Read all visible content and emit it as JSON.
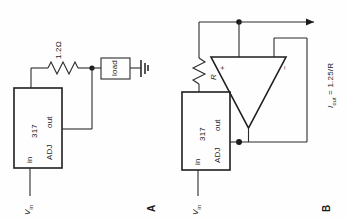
{
  "figure": {
    "orientation": "rotated-90-ccw",
    "type": "schematic-circuit-diagram",
    "panels": [
      {
        "id": "A",
        "label": "A",
        "caption": "LM317 two-terminal current source",
        "components": {
          "regulator": {
            "part_label": "317",
            "pin_in": "in",
            "pin_out": "out",
            "pin_adj": "ADJ"
          },
          "resistor": {
            "label": "1.2Ω",
            "designator": "R"
          },
          "load": {
            "label": "load"
          },
          "ground": {
            "name": "ground-symbol"
          },
          "input": {
            "label": "V",
            "sub": "in"
          }
        }
      },
      {
        "id": "B",
        "label": "B",
        "caption": "Op-amp assisted 317 current source",
        "components": {
          "regulator": {
            "part_label": "317",
            "pin_in": "in",
            "pin_out": "out",
            "pin_adj": "ADJ"
          },
          "resistor": {
            "label": "R",
            "designator": "R"
          },
          "opamp": {
            "plus": "+",
            "minus": "−"
          },
          "input": {
            "label": "V",
            "sub": "in"
          },
          "output": {
            "symbol": "I",
            "sub": "out",
            "equation": " = 1.25/R",
            "full": "I out = 1.25/R"
          }
        }
      }
    ],
    "colors": {
      "line": "#2b2b2b",
      "text": "#1a1a1a",
      "background": "#fefefe"
    }
  }
}
